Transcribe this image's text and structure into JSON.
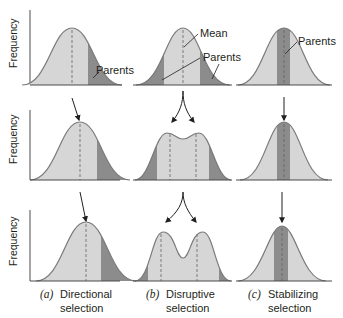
{
  "figure": {
    "y_axis_label": "Frequency",
    "colors": {
      "curve_fill": "#d6d6d6",
      "curve_stroke": "#7a7a7a",
      "parents_fill": "#8c8c8c",
      "mean_line": "#7a7a7a",
      "arrow": "#231f20",
      "axis": "#4a4a4a",
      "text": "#231f20"
    },
    "annotations": {
      "parents_a": "Parents",
      "mean_b": "Mean",
      "parents_b": "Parents",
      "parents_c": "Parents"
    },
    "columns": [
      {
        "letter": "(a)",
        "caption_line1": "Directional",
        "caption_line2": "selection",
        "generations": [
          {
            "shape": "unimodal",
            "mean_pos": "center",
            "parents_region": "right tail"
          },
          {
            "shape": "unimodal",
            "mean_pos": "shifted right",
            "parents_region": "right tail"
          },
          {
            "shape": "unimodal",
            "mean_pos": "shifted further right",
            "parents_region": "right tail"
          }
        ]
      },
      {
        "letter": "(b)",
        "caption_line1": "Disruptive",
        "caption_line2": "selection",
        "generations": [
          {
            "shape": "unimodal",
            "mean_pos": "center",
            "parents_region": "both tails"
          },
          {
            "shape": "bimodal-slight",
            "mean_pos": "two modes",
            "parents_region": "both tails"
          },
          {
            "shape": "bimodal",
            "mean_pos": "two modes",
            "parents_region": "both tails"
          }
        ]
      },
      {
        "letter": "(c)",
        "caption_line1": "Stabilizing",
        "caption_line2": "selection",
        "generations": [
          {
            "shape": "unimodal",
            "mean_pos": "center",
            "parents_region": "center band"
          },
          {
            "shape": "unimodal-narrower",
            "mean_pos": "center",
            "parents_region": "center band"
          },
          {
            "shape": "unimodal-narrowest",
            "mean_pos": "center",
            "parents_region": "center band"
          }
        ]
      }
    ]
  }
}
